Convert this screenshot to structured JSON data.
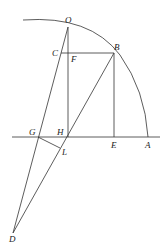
{
  "diagram": {
    "labels": {
      "O": "O",
      "B": "B",
      "C": "C",
      "F": "F",
      "G": "G",
      "H": "H",
      "E": "E",
      "A": "A",
      "L": "L",
      "D": "D"
    },
    "stroke_color": "#333333"
  }
}
